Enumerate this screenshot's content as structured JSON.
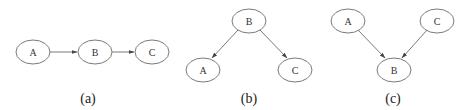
{
  "colors": {
    "stroke": "#6b6b6b",
    "label": "#333333",
    "caption": "#222222",
    "background": "#ffffff"
  },
  "panels": [
    {
      "caption": "(a)",
      "structure": "chain",
      "nodes": [
        {
          "id": "A",
          "label": "A"
        },
        {
          "id": "B",
          "label": "B"
        },
        {
          "id": "C",
          "label": "C"
        }
      ],
      "edges": [
        {
          "from": "A",
          "to": "B"
        },
        {
          "from": "B",
          "to": "C"
        }
      ]
    },
    {
      "caption": "(b)",
      "structure": "fork",
      "nodes": [
        {
          "id": "B",
          "label": "B"
        },
        {
          "id": "A",
          "label": "A"
        },
        {
          "id": "C",
          "label": "C"
        }
      ],
      "edges": [
        {
          "from": "B",
          "to": "A"
        },
        {
          "from": "B",
          "to": "C"
        }
      ]
    },
    {
      "caption": "(c)",
      "structure": "collider",
      "nodes": [
        {
          "id": "A",
          "label": "A"
        },
        {
          "id": "C",
          "label": "C"
        },
        {
          "id": "B",
          "label": "B"
        }
      ],
      "edges": [
        {
          "from": "A",
          "to": "B"
        },
        {
          "from": "C",
          "to": "B"
        }
      ]
    }
  ]
}
